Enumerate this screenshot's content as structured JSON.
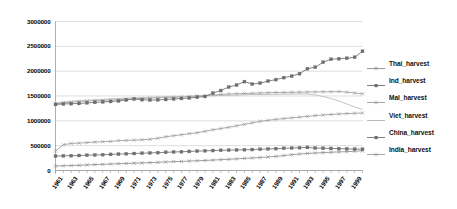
{
  "chart_data": {
    "type": "line",
    "title": "",
    "xlabel": "",
    "ylabel": "",
    "ylim": [
      0,
      3000000
    ],
    "ytick_values": [
      0,
      500000,
      1000000,
      1500000,
      2000000,
      2500000,
      3000000
    ],
    "ytick_labels": [
      "0",
      "500000",
      "1000000",
      "1500000",
      "2000000",
      "2500000",
      "3000000"
    ],
    "grid": true,
    "grid_axis": "y",
    "legend_position": "right",
    "x": [
      1961,
      1962,
      1963,
      1964,
      1965,
      1966,
      1967,
      1968,
      1969,
      1970,
      1971,
      1972,
      1973,
      1974,
      1975,
      1976,
      1977,
      1978,
      1979,
      1980,
      1981,
      1982,
      1983,
      1984,
      1985,
      1986,
      1987,
      1988,
      1989,
      1990,
      1991,
      1992,
      1993,
      1994,
      1995,
      1996,
      1997,
      1998,
      1999,
      2000
    ],
    "xtick_labels": [
      "1961",
      "1963",
      "1965",
      "1967",
      "1969",
      "1971",
      "1973",
      "1975",
      "1977",
      "1979",
      "1981",
      "1983",
      "1985",
      "1987",
      "1989",
      "1991",
      "1993",
      "1995",
      "1997",
      "1999"
    ],
    "series": [
      {
        "name": "Thai_harvest",
        "marker": "cross",
        "color": "#8c8c8c",
        "values": [
          90000,
          95000,
          100000,
          105000,
          112000,
          118000,
          124000,
          130000,
          136000,
          142000,
          148000,
          152000,
          158000,
          165000,
          172000,
          178000,
          183000,
          190000,
          196000,
          203000,
          210000,
          218000,
          226000,
          234000,
          244000,
          252000,
          262000,
          272000,
          285000,
          300000,
          318000,
          332000,
          344000,
          352000,
          360000,
          368000,
          374000,
          380000,
          388000,
          396000
        ]
      },
      {
        "name": "Ind_harvest",
        "marker": "square",
        "color": "#707070",
        "values": [
          290000,
          295000,
          298000,
          302000,
          308000,
          312000,
          318000,
          324000,
          330000,
          336000,
          342000,
          348000,
          354000,
          360000,
          366000,
          372000,
          378000,
          384000,
          390000,
          396000,
          402000,
          406000,
          410000,
          414000,
          418000,
          422000,
          428000,
          434000,
          440000,
          446000,
          452000,
          458000,
          464000,
          452000,
          448000,
          444000,
          440000,
          436000,
          432000,
          428000
        ]
      },
      {
        "name": "Mal_harvest",
        "marker": "cross",
        "color": "#999999",
        "values": [
          1340000,
          1360000,
          1375000,
          1390000,
          1400000,
          1410000,
          1415000,
          1420000,
          1425000,
          1435000,
          1445000,
          1450000,
          1460000,
          1465000,
          1470000,
          1475000,
          1480000,
          1490000,
          1500000,
          1510000,
          1520000,
          1530000,
          1540000,
          1545000,
          1550000,
          1555000,
          1560000,
          1565000,
          1570000,
          1572000,
          1575000,
          1578000,
          1580000,
          1582000,
          1584000,
          1586000,
          1588000,
          1578000,
          1560000,
          1545000
        ]
      },
      {
        "name": "Viet_harvest",
        "marker": "none",
        "color": "#b0b0b0",
        "values": [
          1360000,
          1380000,
          1395000,
          1405000,
          1415000,
          1420000,
          1430000,
          1440000,
          1450000,
          1455000,
          1462000,
          1468000,
          1472000,
          1478000,
          1483000,
          1488000,
          1492000,
          1496000,
          1500000,
          1504000,
          1508000,
          1512000,
          1516000,
          1520000,
          1524000,
          1528000,
          1530000,
          1532000,
          1534000,
          1536000,
          1538000,
          1540000,
          1540000,
          1520000,
          1490000,
          1450000,
          1400000,
          1340000,
          1280000,
          1230000
        ]
      },
      {
        "name": "China_harvest",
        "marker": "square",
        "color": "#6e6e6e",
        "values": [
          1330000,
          1340000,
          1345000,
          1350000,
          1362000,
          1372000,
          1380000,
          1390000,
          1400000,
          1420000,
          1440000,
          1425000,
          1418000,
          1422000,
          1430000,
          1440000,
          1450000,
          1460000,
          1475000,
          1490000,
          1560000,
          1610000,
          1680000,
          1720000,
          1790000,
          1740000,
          1760000,
          1800000,
          1830000,
          1870000,
          1900000,
          1950000,
          2050000,
          2080000,
          2180000,
          2240000,
          2250000,
          2260000,
          2280000,
          2400000
        ]
      },
      {
        "name": "India_harvest",
        "marker": "cross",
        "color": "#9a9a9a",
        "values": [
          392000,
          520000,
          545000,
          552000,
          562000,
          572000,
          580000,
          586000,
          600000,
          606000,
          612000,
          618000,
          630000,
          650000,
          680000,
          700000,
          720000,
          742000,
          760000,
          790000,
          820000,
          845000,
          870000,
          900000,
          930000,
          960000,
          990000,
          1010000,
          1030000,
          1045000,
          1060000,
          1075000,
          1090000,
          1105000,
          1118000,
          1128000,
          1138000,
          1146000,
          1152000,
          1158000
        ]
      }
    ]
  }
}
